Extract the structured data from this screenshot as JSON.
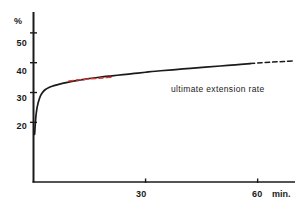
{
  "chart_data": {
    "type": "line",
    "title": "",
    "subtitle": "",
    "xlabel": "min.",
    "ylabel": "%",
    "xlim": [
      0,
      70
    ],
    "ylim": [
      0,
      57
    ],
    "grid": false,
    "legend_position": "none",
    "x_ticks": [
      {
        "value": 30,
        "label": "30"
      },
      {
        "value": 60,
        "label": "60"
      }
    ],
    "y_ticks": [
      {
        "value": 20,
        "label": "20"
      },
      {
        "value": 30,
        "label": "30"
      },
      {
        "value": 40,
        "label": "40"
      },
      {
        "value": 50,
        "label": "50"
      }
    ],
    "annotations": [
      {
        "text": "ultimate extension rate",
        "x": 38,
        "y": 33
      }
    ],
    "series": [
      {
        "name": "extension rate",
        "style": "solid",
        "color": "#1a1a1a",
        "x": [
          0.3,
          0.6,
          0.9,
          1.2,
          1.6,
          2.0,
          2.6,
          3.2,
          4.0,
          5.0,
          6.0,
          7.5,
          9.0,
          11.0,
          13.0,
          15.0,
          18.0,
          21.0,
          24.0,
          27.0,
          30.0,
          34.0,
          38.0,
          42.0,
          46.0,
          50.0,
          54.0,
          58.0
        ],
        "y": [
          16.0,
          21.5,
          24.5,
          26.3,
          28.0,
          29.2,
          30.3,
          31.0,
          31.6,
          32.1,
          32.5,
          33.0,
          33.4,
          33.9,
          34.3,
          34.7,
          35.2,
          35.6,
          36.0,
          36.4,
          36.8,
          37.3,
          37.7,
          38.1,
          38.5,
          38.9,
          39.3,
          39.7
        ]
      },
      {
        "name": "extrapolated extension",
        "style": "dashed",
        "color": "#1a1a1a",
        "x": [
          58.0,
          61.0,
          64.0,
          67.0,
          70.0
        ],
        "y": [
          39.7,
          40.0,
          40.2,
          40.4,
          40.6
        ]
      },
      {
        "name": "tangent guide",
        "style": "dashed",
        "color": "#d83a3a",
        "x": [
          9.5,
          12.5,
          15.5,
          18.5,
          21.5
        ],
        "y": [
          33.9,
          34.3,
          34.6,
          34.9,
          35.2
        ]
      }
    ]
  },
  "axis": {
    "y_axis_name": "y-axis",
    "x_axis_name": "x-axis",
    "unit_symbol": "%",
    "unit_time": "min."
  }
}
